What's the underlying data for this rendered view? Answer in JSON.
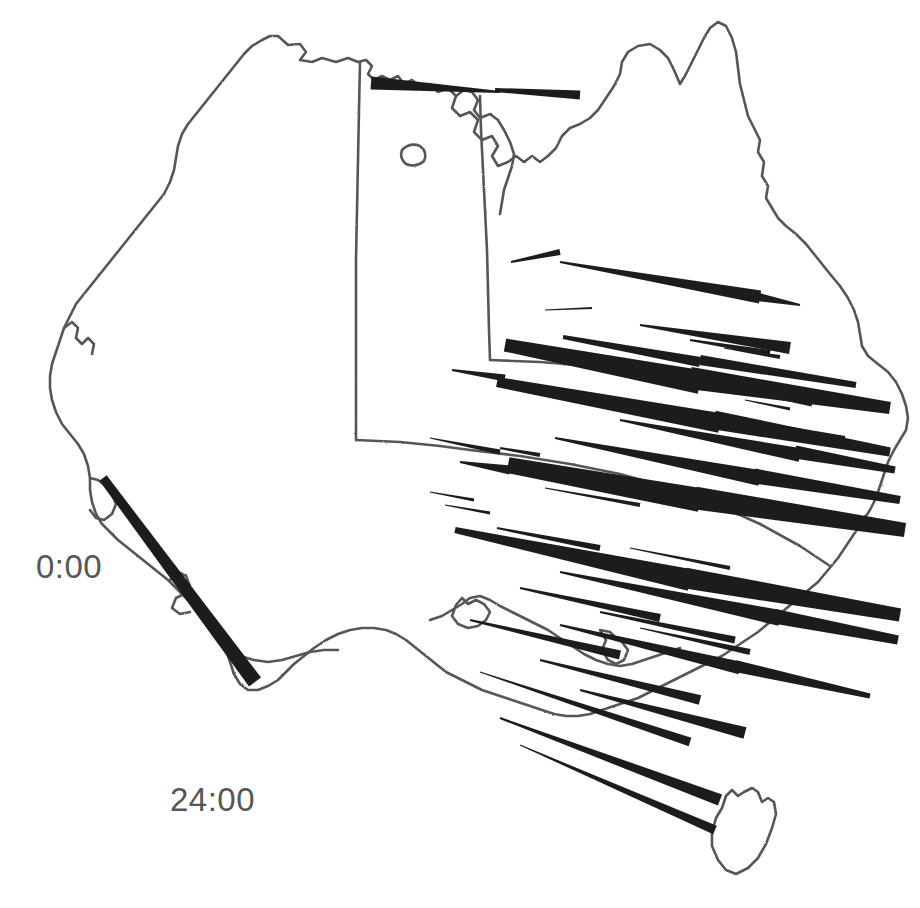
{
  "figure": {
    "type": "map",
    "region": "Australia",
    "background_color": "#ffffff",
    "coast_color": "#565656",
    "wedge_color": "#1f1f1f",
    "label_color": "#565656"
  },
  "labels": {
    "start_time": "0:00",
    "end_time": "24:00"
  },
  "chart_data": {
    "type": "map",
    "title": "",
    "xlabel": "",
    "ylabel": "",
    "legend": [
      "0:00",
      "24:00"
    ],
    "annotations": [
      {
        "text": "0:00",
        "x": 36,
        "y": 550
      },
      {
        "text": "24:00",
        "x": 170,
        "y": 783
      }
    ],
    "glyph_type": "tapered-wedge",
    "glyph_count": 48,
    "glyphs": [
      {
        "x1": 371,
        "y1": 83,
        "x2": 500,
        "y2": 92,
        "w1": 13,
        "w2": 2
      },
      {
        "x1": 495,
        "y1": 90,
        "x2": 580,
        "y2": 95,
        "w1": 4,
        "w2": 9
      },
      {
        "x1": 511,
        "y1": 262,
        "x2": 560,
        "y2": 252,
        "w1": 2,
        "w2": 6
      },
      {
        "x1": 560,
        "y1": 262,
        "x2": 760,
        "y2": 297,
        "w1": 2,
        "w2": 13
      },
      {
        "x1": 753,
        "y1": 296,
        "x2": 800,
        "y2": 305,
        "w1": 9,
        "w2": 2
      },
      {
        "x1": 545,
        "y1": 310,
        "x2": 592,
        "y2": 308,
        "w1": 1,
        "w2": 2
      },
      {
        "x1": 640,
        "y1": 325,
        "x2": 790,
        "y2": 348,
        "w1": 2,
        "w2": 12
      },
      {
        "x1": 690,
        "y1": 340,
        "x2": 770,
        "y2": 353,
        "w1": 2,
        "w2": 6
      },
      {
        "x1": 724,
        "y1": 348,
        "x2": 780,
        "y2": 357,
        "w1": 1,
        "w2": 4
      },
      {
        "x1": 505,
        "y1": 345,
        "x2": 700,
        "y2": 382,
        "w1": 13,
        "w2": 24
      },
      {
        "x1": 563,
        "y1": 337,
        "x2": 700,
        "y2": 362,
        "w1": 4,
        "w2": 10
      },
      {
        "x1": 690,
        "y1": 378,
        "x2": 890,
        "y2": 408,
        "w1": 22,
        "w2": 12
      },
      {
        "x1": 700,
        "y1": 360,
        "x2": 856,
        "y2": 385,
        "w1": 10,
        "w2": 6
      },
      {
        "x1": 452,
        "y1": 370,
        "x2": 505,
        "y2": 378,
        "w1": 2,
        "w2": 7
      },
      {
        "x1": 497,
        "y1": 382,
        "x2": 720,
        "y2": 423,
        "w1": 10,
        "w2": 20
      },
      {
        "x1": 714,
        "y1": 420,
        "x2": 890,
        "y2": 452,
        "w1": 19,
        "w2": 9
      },
      {
        "x1": 740,
        "y1": 390,
        "x2": 812,
        "y2": 404,
        "w1": 2,
        "w2": 5
      },
      {
        "x1": 745,
        "y1": 400,
        "x2": 790,
        "y2": 409,
        "w1": 1,
        "w2": 3
      },
      {
        "x1": 745,
        "y1": 420,
        "x2": 845,
        "y2": 438,
        "w1": 2,
        "w2": 4
      },
      {
        "x1": 768,
        "y1": 430,
        "x2": 820,
        "y2": 440,
        "w1": 1,
        "w2": 3
      },
      {
        "x1": 620,
        "y1": 420,
        "x2": 800,
        "y2": 455,
        "w1": 2,
        "w2": 14
      },
      {
        "x1": 795,
        "y1": 452,
        "x2": 895,
        "y2": 470,
        "w1": 13,
        "w2": 7
      },
      {
        "x1": 555,
        "y1": 438,
        "x2": 760,
        "y2": 478,
        "w1": 2,
        "w2": 16
      },
      {
        "x1": 754,
        "y1": 476,
        "x2": 900,
        "y2": 500,
        "w1": 15,
        "w2": 8
      },
      {
        "x1": 500,
        "y1": 448,
        "x2": 540,
        "y2": 455,
        "w1": 2,
        "w2": 4
      },
      {
        "x1": 430,
        "y1": 438,
        "x2": 500,
        "y2": 452,
        "w1": 1,
        "w2": 5
      },
      {
        "x1": 508,
        "y1": 465,
        "x2": 700,
        "y2": 500,
        "w1": 16,
        "w2": 24
      },
      {
        "x1": 695,
        "y1": 498,
        "x2": 905,
        "y2": 530,
        "w1": 23,
        "w2": 14
      },
      {
        "x1": 460,
        "y1": 462,
        "x2": 510,
        "y2": 470,
        "w1": 2,
        "w2": 9
      },
      {
        "x1": 545,
        "y1": 488,
        "x2": 640,
        "y2": 505,
        "w1": 1,
        "w2": 4
      },
      {
        "x1": 430,
        "y1": 492,
        "x2": 474,
        "y2": 500,
        "w1": 1,
        "w2": 3
      },
      {
        "x1": 445,
        "y1": 505,
        "x2": 490,
        "y2": 513,
        "w1": 1,
        "w2": 3
      },
      {
        "x1": 455,
        "y1": 530,
        "x2": 690,
        "y2": 580,
        "w1": 6,
        "w2": 22
      },
      {
        "x1": 685,
        "y1": 578,
        "x2": 900,
        "y2": 615,
        "w1": 21,
        "w2": 13
      },
      {
        "x1": 497,
        "y1": 528,
        "x2": 600,
        "y2": 548,
        "w1": 2,
        "w2": 6
      },
      {
        "x1": 585,
        "y1": 553,
        "x2": 700,
        "y2": 575,
        "w1": 1,
        "w2": 5
      },
      {
        "x1": 630,
        "y1": 548,
        "x2": 730,
        "y2": 568,
        "w1": 1,
        "w2": 4
      },
      {
        "x1": 560,
        "y1": 572,
        "x2": 780,
        "y2": 618,
        "w1": 2,
        "w2": 16
      },
      {
        "x1": 773,
        "y1": 616,
        "x2": 898,
        "y2": 640,
        "w1": 15,
        "w2": 9
      },
      {
        "x1": 520,
        "y1": 588,
        "x2": 660,
        "y2": 618,
        "w1": 2,
        "w2": 8
      },
      {
        "x1": 600,
        "y1": 612,
        "x2": 735,
        "y2": 640,
        "w1": 2,
        "w2": 7
      },
      {
        "x1": 640,
        "y1": 628,
        "x2": 750,
        "y2": 652,
        "w1": 1,
        "w2": 6
      },
      {
        "x1": 560,
        "y1": 625,
        "x2": 740,
        "y2": 668,
        "w1": 2,
        "w2": 13
      },
      {
        "x1": 735,
        "y1": 666,
        "x2": 870,
        "y2": 696,
        "w1": 12,
        "w2": 5
      },
      {
        "x1": 470,
        "y1": 620,
        "x2": 620,
        "y2": 655,
        "w1": 2,
        "w2": 9
      },
      {
        "x1": 540,
        "y1": 660,
        "x2": 700,
        "y2": 700,
        "w1": 2,
        "w2": 10
      },
      {
        "x1": 580,
        "y1": 690,
        "x2": 745,
        "y2": 733,
        "w1": 2,
        "w2": 12
      },
      {
        "x1": 480,
        "y1": 672,
        "x2": 690,
        "y2": 742,
        "w1": 1,
        "w2": 9
      },
      {
        "x1": 500,
        "y1": 718,
        "x2": 720,
        "y2": 800,
        "w1": 2,
        "w2": 12
      },
      {
        "x1": 520,
        "y1": 745,
        "x2": 715,
        "y2": 830,
        "w1": 1,
        "w2": 9
      },
      {
        "x1": 103,
        "y1": 478,
        "x2": 255,
        "y2": 682,
        "w1": 9,
        "w2": 15
      }
    ]
  }
}
